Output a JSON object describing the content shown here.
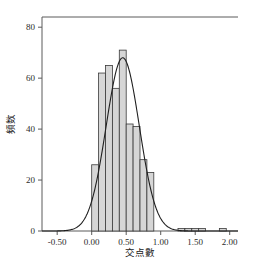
{
  "chart_data": {
    "type": "bar",
    "title": "",
    "subtitle": "",
    "xlabel": "交点數",
    "ylabel": "頻数",
    "xlim": [
      -0.72,
      2.12
    ],
    "ylim": [
      0,
      84
    ],
    "xticks": [
      -0.5,
      0.0,
      0.5,
      1.0,
      1.5,
      2.0
    ],
    "xtick_labels": [
      "-0.50",
      "0.00",
      "0.50",
      "1.00",
      "1.50",
      "2.00"
    ],
    "yticks": [
      0,
      20,
      40,
      60,
      80
    ],
    "ytick_labels": [
      "0",
      "20",
      "40",
      "60",
      "80"
    ],
    "grid": false,
    "legend": "none",
    "bin_width": 0.1,
    "bar_color": "#d6d6d6",
    "bar_edge_color": "#3a3a3a",
    "curve_color": "#1f1f1f",
    "axis_color": "#4d4d4d",
    "bins": [
      {
        "left": 0.0,
        "right": 0.1,
        "value": 26
      },
      {
        "left": 0.1,
        "right": 0.2,
        "value": 62
      },
      {
        "left": 0.2,
        "right": 0.3,
        "value": 65
      },
      {
        "left": 0.3,
        "right": 0.4,
        "value": 56
      },
      {
        "left": 0.4,
        "right": 0.5,
        "value": 71
      },
      {
        "left": 0.5,
        "right": 0.6,
        "value": 42
      },
      {
        "left": 0.6,
        "right": 0.7,
        "value": 41
      },
      {
        "left": 0.7,
        "right": 0.8,
        "value": 28
      },
      {
        "left": 0.8,
        "right": 0.9,
        "value": 23
      },
      {
        "left": 1.25,
        "right": 1.35,
        "value": 1
      },
      {
        "left": 1.35,
        "right": 1.45,
        "value": 1
      },
      {
        "left": 1.45,
        "right": 1.55,
        "value": 1
      },
      {
        "left": 1.55,
        "right": 1.65,
        "value": 1
      },
      {
        "left": 1.85,
        "right": 1.95,
        "value": 1
      }
    ],
    "categories": [
      "0.00",
      "0.10",
      "0.20",
      "0.30",
      "0.40",
      "0.50",
      "0.60",
      "0.70",
      "0.80",
      "1.25",
      "1.35",
      "1.45",
      "1.55",
      "1.85"
    ],
    "values": [
      26,
      62,
      65,
      56,
      71,
      42,
      41,
      28,
      23,
      1,
      1,
      1,
      1,
      1
    ],
    "curve": {
      "name": "normal-density-overlay",
      "peak_x": 0.45,
      "peak_y": 68,
      "mean": 0.45,
      "sigma": 0.24,
      "amplitude": 68,
      "x_start": -0.72,
      "x_end": 2.12
    }
  }
}
